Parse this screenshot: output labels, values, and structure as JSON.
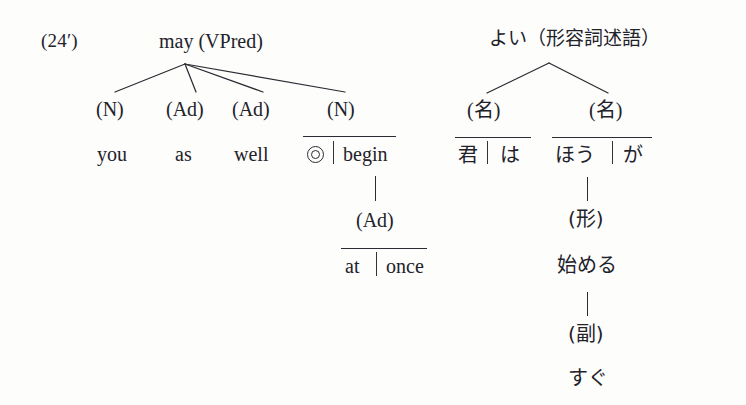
{
  "figure": {
    "number_label": "(24′)",
    "ink_color": "#22222a",
    "background_color": "#fdfdfc"
  },
  "english_tree": {
    "root": "may (VPred)",
    "categories": [
      "(N)",
      "(Ad)",
      "(Ad)",
      "(N)"
    ],
    "leaves": [
      {
        "word": "you",
        "overlined": false
      },
      {
        "word": "as",
        "overlined": false
      },
      {
        "word": "well",
        "overlined": false
      }
    ],
    "boxed_leaf": {
      "marker_icon": "bullseye-icon",
      "marker_glyph": "◎",
      "word": "begin",
      "overlined": true
    },
    "subordinate": {
      "category": "(Ad)",
      "left": "at",
      "right": "once",
      "overlined": true
    }
  },
  "japanese_tree": {
    "root": "よい（形容詞述語）",
    "categories": [
      "(名)",
      "(名)"
    ],
    "leaf_pairs": [
      {
        "left": "君",
        "right": "は",
        "overlined": true
      },
      {
        "left": "ほう",
        "right": "が",
        "overlined": true
      }
    ],
    "chain": [
      {
        "label": "(形)",
        "type": "category"
      },
      {
        "label": "始める",
        "type": "word"
      },
      {
        "label": "(副)",
        "type": "category"
      },
      {
        "label": "すぐ",
        "type": "word"
      }
    ]
  }
}
